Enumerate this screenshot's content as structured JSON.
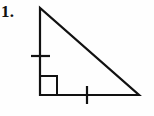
{
  "figure": {
    "label": "1.",
    "label_name": "problem-number",
    "background_color": "#fefefe",
    "stroke_color": "#111111",
    "shape_type": "right-triangle",
    "stroke_width": 2.2
  },
  "geometry": {
    "vertices": {
      "apex": {
        "name": "top-vertex",
        "x": 40,
        "y": 8
      },
      "right_angle": {
        "name": "bottom-left-vertex",
        "x": 40,
        "y": 95
      },
      "base_end": {
        "name": "bottom-right-vertex",
        "x": 139,
        "y": 95
      }
    },
    "sides": [
      {
        "name": "vertical-leg",
        "from": "apex",
        "to": "right-angle",
        "tick_marks": 1
      },
      {
        "name": "horizontal-base",
        "from": "right-angle",
        "to": "base-end",
        "tick_marks": 1
      },
      {
        "name": "hypotenuse",
        "from": "apex",
        "to": "base-end",
        "tick_marks": 0
      }
    ],
    "right_angle_marker": {
      "name": "right-angle-square",
      "x": 40,
      "y": 76,
      "width": 17,
      "height": 19
    },
    "tick_vertical_leg": {
      "name": "tick-vertical-leg",
      "x1": 31,
      "y1": 56,
      "x2": 50,
      "y2": 56
    },
    "tick_base": {
      "name": "tick-base",
      "x1": 87,
      "y1": 86,
      "x2": 87,
      "y2": 104
    }
  }
}
